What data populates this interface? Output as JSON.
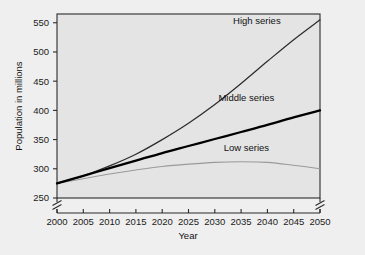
{
  "chart_data": {
    "type": "line",
    "title": "",
    "xlabel": "Year",
    "ylabel": "Population in millions",
    "x": [
      2000,
      2005,
      2010,
      2015,
      2020,
      2025,
      2030,
      2035,
      2040,
      2045,
      2050
    ],
    "xticklabels": [
      "2000",
      "2005",
      "2010",
      "2015",
      "2020",
      "2025",
      "2030",
      "2035",
      "2040",
      "2045",
      "2050"
    ],
    "yticklabels": [
      "250",
      "300",
      "350",
      "400",
      "450",
      "500",
      "550"
    ],
    "yticks": [
      250,
      300,
      350,
      400,
      450,
      500,
      550
    ],
    "xlim": [
      2000,
      2050
    ],
    "ylim": [
      250,
      565
    ],
    "grid": false,
    "legend_position": "inline-curve-labels",
    "y_axis_break": true,
    "y_axis_break_note": "axis broken below 250",
    "series": [
      {
        "name": "High series",
        "color": "#2c2c2c",
        "values": [
          275,
          288,
          305,
          325,
          350,
          378,
          410,
          446,
          484,
          521,
          555
        ]
      },
      {
        "name": "Middle series",
        "color": "#000000",
        "values": [
          275,
          288,
          301,
          314,
          327,
          339,
          351,
          363,
          375,
          388,
          400
        ]
      },
      {
        "name": "Low series",
        "color": "#9a9a9a",
        "values": [
          275,
          283,
          291,
          298,
          304,
          308,
          311,
          312,
          311,
          306,
          300
        ]
      }
    ],
    "annotations": [
      {
        "text": "High series",
        "x": 2038,
        "y": 548
      },
      {
        "text": "Middle series",
        "x": 2036,
        "y": 416
      },
      {
        "text": "Low series",
        "x": 2036,
        "y": 330
      }
    ]
  },
  "axis": {
    "x_title": "Year",
    "y_title": "Population in millions"
  }
}
